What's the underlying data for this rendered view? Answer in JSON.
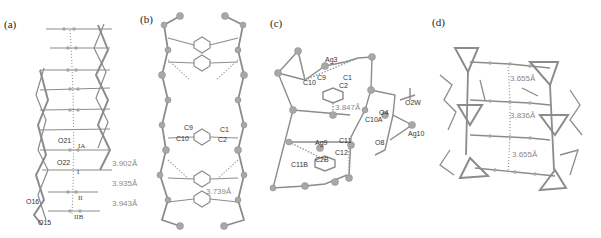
{
  "figure": {
    "panels": [
      {
        "id": "a",
        "label": "(a)",
        "atom_labels": [
          "O21",
          "O22",
          "O16",
          "O15"
        ],
        "stack_labels": [
          "IA",
          "I",
          "II",
          "IIB"
        ],
        "distances": [
          "3.902Å",
          "3.935Å",
          "3.943Å"
        ]
      },
      {
        "id": "b",
        "label": "(b)",
        "atom_labels": [
          "C9",
          "C10",
          "C1",
          "C2"
        ],
        "distances": [
          "3.739Å"
        ]
      },
      {
        "id": "c",
        "label": "(c)",
        "atom_labels": [
          "Ag3",
          "C9",
          "C10",
          "C1",
          "C2",
          "O4",
          "O2W",
          "C10A",
          "O8",
          "Ag10",
          "Ag9",
          "C11",
          "C12",
          "C11B",
          "C2B"
        ],
        "distances": [
          "3.847Å"
        ]
      },
      {
        "id": "d",
        "label": "(d)",
        "distances": [
          "3.655Å",
          "3.836Å",
          "3.655Å"
        ]
      }
    ],
    "colors": {
      "bond": "#8c8c8c",
      "atom": "#a8a8a8",
      "distance_text": "#8a8a8a",
      "label_text": "#333333"
    }
  }
}
